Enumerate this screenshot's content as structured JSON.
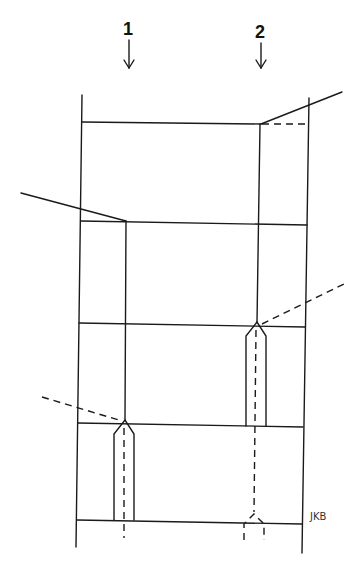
{
  "labels": {
    "marker_1": "1",
    "marker_2": "2",
    "signature": "JKB"
  },
  "colors": {
    "line": "#1a1a1a",
    "background": "#ffffff"
  }
}
